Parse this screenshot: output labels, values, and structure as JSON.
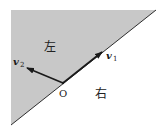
{
  "diagram": {
    "region_left_label": "左",
    "region_right_label": "右",
    "origin_label": "O",
    "vector1": {
      "name": "v",
      "subscript": "1"
    },
    "vector2": {
      "name": "v",
      "subscript": "2"
    },
    "colors": {
      "shaded_region": "#c8c8c8",
      "line": "#1a1a1a",
      "background": "#ffffff"
    }
  }
}
